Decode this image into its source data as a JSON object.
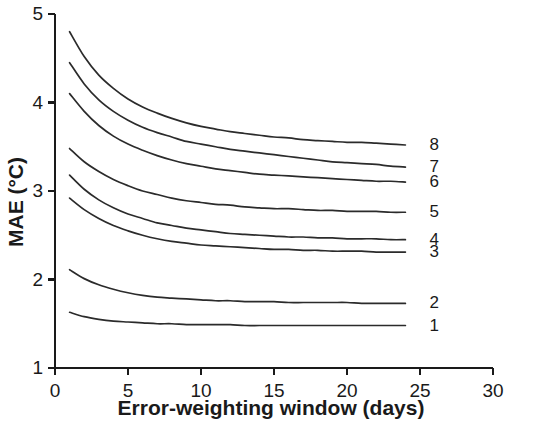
{
  "chart_data": {
    "type": "line",
    "title": "",
    "xlabel": "Error-weighting window (days)",
    "ylabel": "MAE (°C)",
    "xlim": [
      0,
      30
    ],
    "ylim": [
      1,
      5
    ],
    "xticks": [
      0,
      5,
      10,
      15,
      20,
      25,
      30
    ],
    "xtick_labels": [
      "0",
      "5",
      "10",
      "15",
      "20",
      "25",
      "30"
    ],
    "yticks": [
      1,
      2,
      3,
      4,
      5
    ],
    "ytick_labels": [
      "1",
      "2",
      "3",
      "4",
      "5"
    ],
    "grid": false,
    "legend_position": "right-of-curve-ends",
    "x": [
      1,
      2,
      3,
      4,
      5,
      6,
      7,
      8,
      9,
      10,
      11,
      12,
      13,
      14,
      15,
      16,
      17,
      18,
      19,
      20,
      21,
      22,
      23,
      24
    ],
    "series": [
      {
        "name": "8",
        "label": "8",
        "values": [
          4.8,
          4.52,
          4.31,
          4.16,
          4.04,
          3.95,
          3.88,
          3.82,
          3.77,
          3.73,
          3.7,
          3.67,
          3.65,
          3.63,
          3.61,
          3.6,
          3.58,
          3.57,
          3.56,
          3.55,
          3.55,
          3.54,
          3.53,
          3.52
        ]
      },
      {
        "name": "7",
        "label": "7",
        "values": [
          4.45,
          4.21,
          4.03,
          3.9,
          3.8,
          3.72,
          3.66,
          3.61,
          3.56,
          3.53,
          3.5,
          3.47,
          3.45,
          3.43,
          3.41,
          3.39,
          3.37,
          3.35,
          3.33,
          3.32,
          3.31,
          3.3,
          3.28,
          3.27
        ]
      },
      {
        "name": "6",
        "label": "6",
        "values": [
          4.1,
          3.9,
          3.74,
          3.62,
          3.53,
          3.46,
          3.4,
          3.35,
          3.31,
          3.28,
          3.25,
          3.23,
          3.21,
          3.19,
          3.18,
          3.17,
          3.16,
          3.15,
          3.14,
          3.13,
          3.12,
          3.11,
          3.11,
          3.1
        ]
      },
      {
        "name": "5",
        "label": "5",
        "values": [
          3.48,
          3.33,
          3.22,
          3.13,
          3.06,
          3.0,
          2.96,
          2.92,
          2.89,
          2.87,
          2.85,
          2.84,
          2.82,
          2.81,
          2.8,
          2.8,
          2.79,
          2.78,
          2.78,
          2.77,
          2.77,
          2.77,
          2.76,
          2.76
        ]
      },
      {
        "name": "4",
        "label": "4",
        "values": [
          3.18,
          3.02,
          2.9,
          2.81,
          2.74,
          2.69,
          2.64,
          2.61,
          2.58,
          2.56,
          2.54,
          2.52,
          2.51,
          2.5,
          2.49,
          2.48,
          2.48,
          2.47,
          2.47,
          2.46,
          2.46,
          2.46,
          2.45,
          2.45
        ]
      },
      {
        "name": "3",
        "label": "3",
        "values": [
          2.92,
          2.79,
          2.69,
          2.61,
          2.55,
          2.5,
          2.46,
          2.43,
          2.41,
          2.39,
          2.38,
          2.37,
          2.36,
          2.35,
          2.34,
          2.34,
          2.33,
          2.33,
          2.32,
          2.32,
          2.32,
          2.31,
          2.31,
          2.31
        ]
      },
      {
        "name": "2",
        "label": "2",
        "values": [
          2.11,
          2.01,
          1.94,
          1.89,
          1.85,
          1.82,
          1.8,
          1.79,
          1.78,
          1.77,
          1.76,
          1.76,
          1.75,
          1.75,
          1.75,
          1.74,
          1.74,
          1.74,
          1.74,
          1.74,
          1.73,
          1.73,
          1.73,
          1.73
        ]
      },
      {
        "name": "1",
        "label": "1",
        "values": [
          1.63,
          1.58,
          1.55,
          1.53,
          1.52,
          1.51,
          1.5,
          1.5,
          1.49,
          1.49,
          1.49,
          1.49,
          1.48,
          1.48,
          1.48,
          1.48,
          1.48,
          1.48,
          1.48,
          1.48,
          1.48,
          1.48,
          1.48,
          1.48
        ]
      }
    ]
  },
  "footer": {
    "caption": ""
  }
}
